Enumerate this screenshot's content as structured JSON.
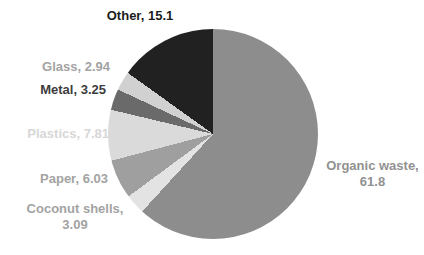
{
  "chart_data": {
    "type": "pie",
    "title": "",
    "legend": "none",
    "start_angle_deg": 0,
    "direction": "clockwise",
    "data_labels": "outside: category name, value",
    "background_color": "#ffffff",
    "slices": [
      {
        "label": "Organic waste",
        "value": 61.8,
        "color": "#8d8d8d"
      },
      {
        "label": "Coconut shells",
        "value": 3.09,
        "color": "#e3e3e3"
      },
      {
        "label": "Paper",
        "value": 6.03,
        "color": "#9f9f9f"
      },
      {
        "label": "Plastics",
        "value": 7.81,
        "color": "#dadada"
      },
      {
        "label": "Metal",
        "value": 3.25,
        "color": "#6a6a6a"
      },
      {
        "label": "Glass",
        "value": 2.94,
        "color": "#d1d1d1"
      },
      {
        "label": "Other",
        "value": 15.1,
        "color": "#212121"
      }
    ]
  },
  "labels": [
    {
      "id": "other",
      "line1": "Other, 15.1",
      "line2": "",
      "color": "#1c1c1c"
    },
    {
      "id": "glass",
      "line1": "Glass, 2.94",
      "line2": "",
      "color": "#a3a3a3"
    },
    {
      "id": "metal",
      "line1": "Metal, 3.25",
      "line2": "",
      "color": "#3d3d3d"
    },
    {
      "id": "plastics",
      "line1": "Plastics, 7.81",
      "line2": "",
      "color": "#d7d7d7"
    },
    {
      "id": "paper",
      "line1": "Paper, 6.03",
      "line2": "",
      "color": "#a3a3a3"
    },
    {
      "id": "coconut",
      "line1": "Coconut shells,",
      "line2": "3.09",
      "color": "#a3a3a3"
    },
    {
      "id": "organic",
      "line1": "Organic waste,",
      "line2": "61.8",
      "color": "#919191"
    }
  ]
}
